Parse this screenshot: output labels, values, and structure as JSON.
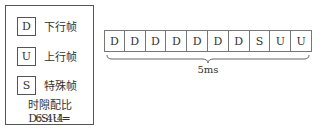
{
  "legend": {
    "items": [
      {
        "symbol": "D",
        "label": "下行帧"
      },
      {
        "symbol": "U",
        "label": "上行帧"
      },
      {
        "symbol": "S",
        "label": "特殊帧"
      }
    ],
    "ratio_line1": "时隙配比 D:S:U=",
    "ratio_line2": "6:4:4"
  },
  "frames": [
    "D",
    "D",
    "D",
    "D",
    "D",
    "D",
    "D",
    "S",
    "U",
    "U"
  ],
  "period_label": "5ms"
}
